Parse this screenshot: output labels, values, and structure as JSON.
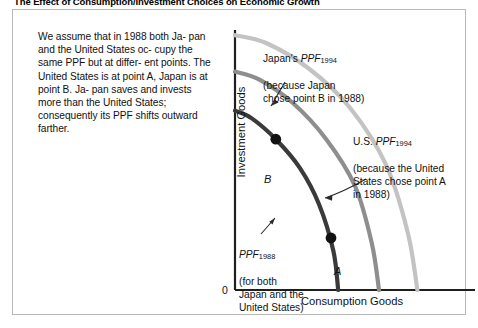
{
  "figure": {
    "title": "The Effect of Consumption/Investment Choices on Economic Growth",
    "caption": "We assume that in 1988 both Japan and the United States occupy the same PPF but at different points. The United States is at point A, Japan is at point B. Japan saves and invests more than the United States; consequently its PPF shifts outward farther.",
    "caption_lines": [
      "We assume that in 1988 both Ja-",
      "pan and the United States oc-",
      "cupy the same PPF but at differ-",
      "ent points. The United States is at",
      "point A, Japan is at point B. Ja-",
      "pan saves and invests more than",
      "the United States; consequently",
      "its PPF shifts outward farther."
    ]
  },
  "chart_data": {
    "type": "line",
    "title": "The Effect of Consumption/Investment Choices on Economic Growth",
    "xlabel": "Consumption Goods",
    "ylabel": "Investment Goods",
    "origin_label": "0",
    "xlim": [
      0,
      100
    ],
    "ylim": [
      0,
      100
    ],
    "grid": false,
    "legend_position": "inline-annotations",
    "axis_ticks": [],
    "series": [
      {
        "name": "PPF1988",
        "label": "PPF",
        "subscript": "1988",
        "color": "#3a3a3a",
        "description": "for both Japan and the United States",
        "y_intercept": 69,
        "x_intercept": 43,
        "points": [
          {
            "x": 0,
            "y": 69
          },
          {
            "x": 7,
            "y": 66
          },
          {
            "x": 17,
            "y": 58
          },
          {
            "x": 27,
            "y": 47
          },
          {
            "x": 35,
            "y": 33
          },
          {
            "x": 41,
            "y": 15
          },
          {
            "x": 43,
            "y": 0
          }
        ]
      },
      {
        "name": "US_PPF1994",
        "label": "U.S. PPF",
        "subscript": "1994",
        "color": "#8e8e8e",
        "description": "because the United States chose point A in 1988",
        "y_intercept": 84,
        "x_intercept": 60,
        "points": [
          {
            "x": 0,
            "y": 84
          },
          {
            "x": 10,
            "y": 81
          },
          {
            "x": 24,
            "y": 72
          },
          {
            "x": 38,
            "y": 58
          },
          {
            "x": 50,
            "y": 40
          },
          {
            "x": 57,
            "y": 18
          },
          {
            "x": 60,
            "y": 0
          }
        ]
      },
      {
        "name": "Japan_PPF1994",
        "label": "Japan's PPF",
        "subscript": "1994",
        "color": "#c3c3c3",
        "description": "because Japan chose point B in 1988",
        "y_intercept": 98,
        "x_intercept": 76,
        "points": [
          {
            "x": 0,
            "y": 98
          },
          {
            "x": 13,
            "y": 95
          },
          {
            "x": 31,
            "y": 85
          },
          {
            "x": 48,
            "y": 70
          },
          {
            "x": 63,
            "y": 48
          },
          {
            "x": 72,
            "y": 22
          },
          {
            "x": 76,
            "y": 0
          }
        ]
      }
    ],
    "points": [
      {
        "name": "B",
        "label": "B",
        "x": 17,
        "y": 58,
        "country": "Japan",
        "year": 1988
      },
      {
        "name": "A",
        "label": "A",
        "x": 40,
        "y": 20,
        "country": "United States",
        "year": 1988
      }
    ],
    "annotations": [
      {
        "name": "japan-ppf-1994",
        "lines": [
          "Japan's PPF1994",
          "(because Japan",
          "chose point B in 1988)"
        ],
        "prefix": "Japan's ",
        "ppf": "PPF",
        "sub": "1994",
        "rest": "(because Japan\nchose point B in 1988)"
      },
      {
        "name": "us-ppf-1994",
        "prefix": "U.S. ",
        "ppf": "PPF",
        "sub": "1994",
        "rest": "(because the United\nStates chose point A\nin 1988)"
      },
      {
        "name": "ppf-1988",
        "prefix": "",
        "ppf": "PPF",
        "sub": "1988",
        "rest": "(for both\nJapan and the\nUnited States)"
      }
    ]
  }
}
